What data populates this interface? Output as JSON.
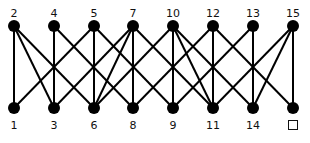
{
  "diagram": {
    "type": "bipartite-graph",
    "top_row": {
      "y": 26,
      "label_y": 8,
      "nodes": [
        {
          "id": "2",
          "label": "2",
          "x": 14
        },
        {
          "id": "4",
          "label": "4",
          "x": 54
        },
        {
          "id": "5",
          "label": "5",
          "x": 94
        },
        {
          "id": "7",
          "label": "7",
          "x": 133
        },
        {
          "id": "10",
          "label": "10",
          "x": 173
        },
        {
          "id": "12",
          "label": "12",
          "x": 213
        },
        {
          "id": "13",
          "label": "13",
          "x": 253
        },
        {
          "id": "15",
          "label": "15",
          "x": 293
        }
      ]
    },
    "bottom_row": {
      "y": 108,
      "label_y": 120,
      "nodes": [
        {
          "id": "1",
          "label": "1",
          "x": 14
        },
        {
          "id": "3",
          "label": "3",
          "x": 54
        },
        {
          "id": "6",
          "label": "6",
          "x": 94
        },
        {
          "id": "8",
          "label": "8",
          "x": 133
        },
        {
          "id": "9",
          "label": "9",
          "x": 173
        },
        {
          "id": "11",
          "label": "11",
          "x": 213
        },
        {
          "id": "14",
          "label": "14",
          "x": 253
        },
        {
          "id": "blank",
          "label": "",
          "x": 293,
          "is_answer_box": true
        }
      ]
    },
    "edges": [
      [
        "2",
        "1"
      ],
      [
        "2",
        "3"
      ],
      [
        "2",
        "6"
      ],
      [
        "4",
        "3"
      ],
      [
        "4",
        "8"
      ],
      [
        "5",
        "1"
      ],
      [
        "5",
        "6"
      ],
      [
        "5",
        "9"
      ],
      [
        "7",
        "3"
      ],
      [
        "7",
        "6"
      ],
      [
        "7",
        "8"
      ],
      [
        "7",
        "11"
      ],
      [
        "10",
        "6"
      ],
      [
        "10",
        "9"
      ],
      [
        "10",
        "11"
      ],
      [
        "10",
        "14"
      ],
      [
        "12",
        "8"
      ],
      [
        "12",
        "11"
      ],
      [
        "12",
        "blank"
      ],
      [
        "13",
        "9"
      ],
      [
        "13",
        "14"
      ],
      [
        "15",
        "11"
      ],
      [
        "15",
        "14"
      ],
      [
        "15",
        "blank"
      ]
    ],
    "style": {
      "node_color": "#000000",
      "edge_color": "#000000",
      "node_radius": 6,
      "edge_width": 2
    }
  }
}
